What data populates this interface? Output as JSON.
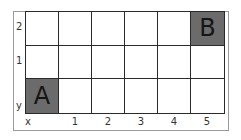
{
  "diagram": {
    "columns": 6,
    "rows": 3,
    "y_axis_label": "y",
    "x_axis_label": "x",
    "y_ticks": [
      "2",
      "1"
    ],
    "x_ticks": [
      "1",
      "2",
      "3",
      "4",
      "5"
    ],
    "points": [
      {
        "label": "A",
        "x": 0,
        "y": 0
      },
      {
        "label": "B",
        "x": 5,
        "y": 2
      }
    ],
    "colors": {
      "filled_cell": "#6b6b6b",
      "grid_line": "#2a2a2a",
      "frame": "#9a9a9a"
    }
  }
}
